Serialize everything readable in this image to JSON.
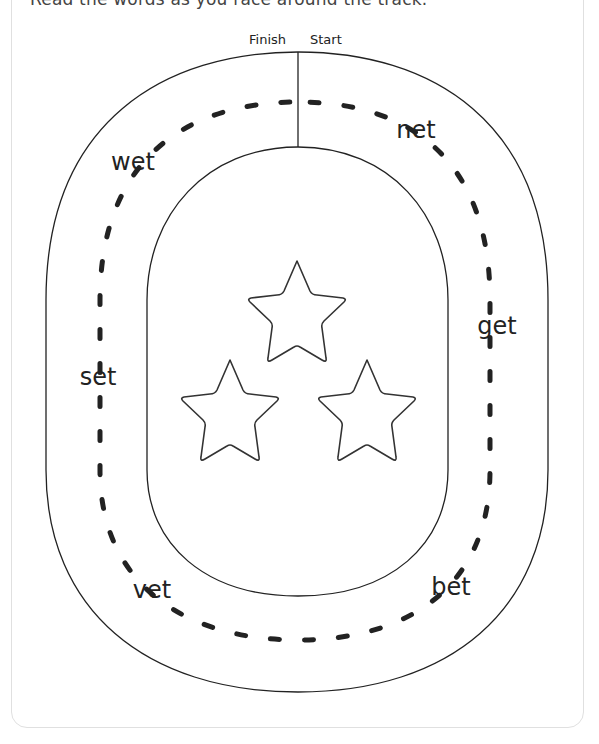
{
  "worksheet": {
    "top_text_cropped": "Read the words as you race around the track.",
    "markers": {
      "finish": "Finish",
      "start": "Start"
    },
    "words": [
      {
        "text": "net",
        "x": 416,
        "y": 130
      },
      {
        "text": "get",
        "x": 497,
        "y": 326
      },
      {
        "text": "bet",
        "x": 451,
        "y": 587
      },
      {
        "text": "vet",
        "x": 152,
        "y": 590
      },
      {
        "text": "set",
        "x": 98,
        "y": 377
      },
      {
        "text": "wet",
        "x": 133,
        "y": 162
      }
    ],
    "stars_count": 3,
    "colors": {
      "line": "#222222",
      "star_stroke": "#333333",
      "card_border": "#e0e0e0"
    }
  }
}
